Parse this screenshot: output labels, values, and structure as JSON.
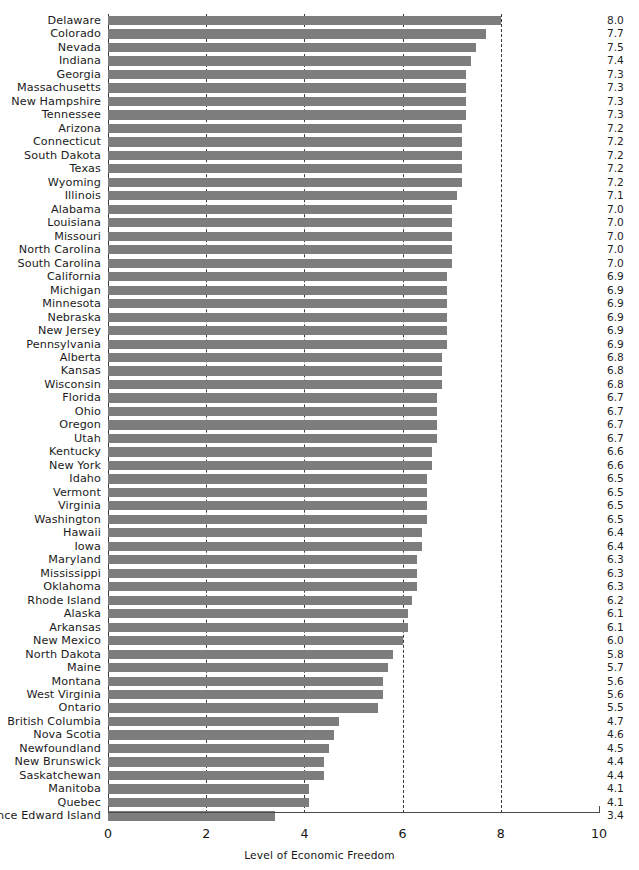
{
  "chart_data": {
    "type": "bar",
    "orientation": "horizontal",
    "title": "",
    "xlabel": "Level of Economic Freedom",
    "ylabel": "",
    "xlim": [
      0,
      10
    ],
    "xticks": [
      "0",
      "2",
      "4",
      "6",
      "8",
      "10"
    ],
    "gridlines": [
      2,
      4,
      6,
      8
    ],
    "grid": true,
    "legend": null,
    "bar_color": "#7d7d7d",
    "categories": [
      "Delaware",
      "Colorado",
      "Nevada",
      "Indiana",
      "Georgia",
      "Massachusetts",
      "New Hampshire",
      "Tennessee",
      "Arizona",
      "Connecticut",
      "South Dakota",
      "Texas",
      "Wyoming",
      "Illinois",
      "Alabama",
      "Louisiana",
      "Missouri",
      "North Carolina",
      "South Carolina",
      "California",
      "Michigan",
      "Minnesota",
      "Nebraska",
      "New Jersey",
      "Pennsylvania",
      "Alberta",
      "Kansas",
      "Wisconsin",
      "Florida",
      "Ohio",
      "Oregon",
      "Utah",
      "Kentucky",
      "New York",
      "Idaho",
      "Vermont",
      "Virginia",
      "Washington",
      "Hawaii",
      "Iowa",
      "Maryland",
      "Mississippi",
      "Oklahoma",
      "Rhode Island",
      "Alaska",
      "Arkansas",
      "New Mexico",
      "North Dakota",
      "Maine",
      "Montana",
      "West Virginia",
      "Ontario",
      "British Columbia",
      "Nova Scotia",
      "Newfoundland",
      "New Brunswick",
      "Saskatchewan",
      "Manitoba",
      "Quebec",
      "Prince Edward Island"
    ],
    "values": [
      8.0,
      7.7,
      7.5,
      7.4,
      7.3,
      7.3,
      7.3,
      7.3,
      7.2,
      7.2,
      7.2,
      7.2,
      7.2,
      7.1,
      7.0,
      7.0,
      7.0,
      7.0,
      7.0,
      6.9,
      6.9,
      6.9,
      6.9,
      6.9,
      6.9,
      6.8,
      6.8,
      6.8,
      6.7,
      6.7,
      6.7,
      6.7,
      6.6,
      6.6,
      6.5,
      6.5,
      6.5,
      6.5,
      6.4,
      6.4,
      6.3,
      6.3,
      6.3,
      6.2,
      6.1,
      6.1,
      6.0,
      5.8,
      5.7,
      5.6,
      5.6,
      5.5,
      4.7,
      4.6,
      4.5,
      4.4,
      4.4,
      4.1,
      4.1,
      3.4
    ],
    "value_labels": [
      "8.0",
      "7.7",
      "7.5",
      "7.4",
      "7.3",
      "7.3",
      "7.3",
      "7.3",
      "7.2",
      "7.2",
      "7.2",
      "7.2",
      "7.2",
      "7.1",
      "7.0",
      "7.0",
      "7.0",
      "7.0",
      "7.0",
      "6.9",
      "6.9",
      "6.9",
      "6.9",
      "6.9",
      "6.9",
      "6.8",
      "6.8",
      "6.8",
      "6.7",
      "6.7",
      "6.7",
      "6.7",
      "6.6",
      "6.6",
      "6.5",
      "6.5",
      "6.5",
      "6.5",
      "6.4",
      "6.4",
      "6.3",
      "6.3",
      "6.3",
      "6.2",
      "6.1",
      "6.1",
      "6.0",
      "5.8",
      "5.7",
      "5.6",
      "5.6",
      "5.5",
      "4.7",
      "4.6",
      "4.5",
      "4.4",
      "4.4",
      "4.1",
      "4.1",
      "3.4"
    ]
  }
}
